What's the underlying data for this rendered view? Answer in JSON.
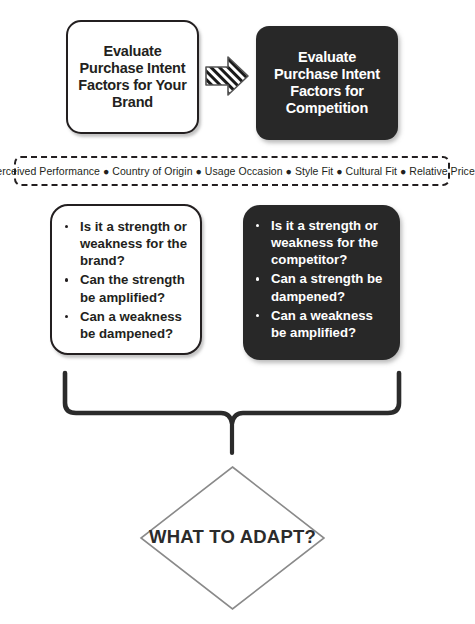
{
  "diagram": {
    "background_color": "#ffffff",
    "dark_fill_color": "#282828",
    "outline_color": "#231f20"
  },
  "top_row": {
    "brand_box": {
      "lines": [
        "Evaluate",
        "Purchase Intent",
        "Factors for Your",
        "Brand"
      ],
      "style": "light"
    },
    "arrow": {
      "icon": "hatched-right-arrow",
      "direction": "right"
    },
    "competition_box": {
      "lines": [
        "Evaluate",
        "Purchase Intent",
        "Factors for",
        "Competition"
      ],
      "style": "dark"
    }
  },
  "factors_band": {
    "separator": "●",
    "items": [
      "Perceived Performance",
      "Country of Origin",
      "Usage Occasion",
      "Style Fit",
      "Cultural Fit",
      "Relative Price"
    ],
    "text": "Perceived Performance ● Country of Origin ● Usage Occasion ● Style Fit ● Cultural Fit ● Relative Price"
  },
  "question_boxes": {
    "brand": {
      "style": "light",
      "items": [
        "Is it a strength or weakness for the brand?",
        "Can the strength be amplified?",
        "Can a weakness be dampened?"
      ]
    },
    "competitor": {
      "style": "dark",
      "items": [
        "Is it a strength or weakness for the competitor?",
        "Can a strength be dampened?",
        "Can a weakness be amplified?"
      ]
    }
  },
  "connector": {
    "icon": "curly-brace-down"
  },
  "outcome": {
    "shape": "diamond",
    "label": "WHAT TO ADAPT?"
  }
}
